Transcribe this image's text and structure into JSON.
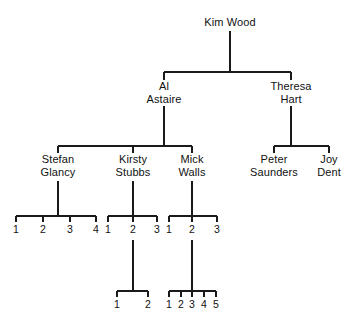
{
  "diagram": {
    "line_color": "#1a1a1a",
    "background": "#ffffff",
    "text_color": "#111111"
  },
  "people": {
    "root": {
      "name": "Kim Wood",
      "line1": "Kim Wood",
      "line2": ""
    },
    "gen2": [
      {
        "name": "Al Astaire",
        "line1": "Al",
        "line2": "Astaire"
      },
      {
        "name": "Theresa Hart",
        "line1": "Theresa",
        "line2": "Hart"
      }
    ],
    "gen3": [
      {
        "name": "Stefan Glancy",
        "line1": "Stefan",
        "line2": "Glancy"
      },
      {
        "name": "Kirsty Stubbs",
        "line1": "Kirsty",
        "line2": "Stubbs"
      },
      {
        "name": "Mick Walls",
        "line1": "Mick",
        "line2": "Walls"
      },
      {
        "name": "Peter Saunders",
        "line1": "Peter",
        "line2": "Saunders"
      },
      {
        "name": "Joy Dent",
        "line1": "Joy",
        "line2": "Dent"
      }
    ]
  },
  "numbered_children": {
    "stefan_glancy_children": [
      "1",
      "2",
      "3",
      "4"
    ],
    "kirsty_stubbs_children": [
      "1",
      "2",
      "3"
    ],
    "mick_walls_children": [
      "1",
      "2",
      "3"
    ],
    "kirsty_grandchildren": [
      "1",
      "2"
    ],
    "mick_grandchildren": [
      "1",
      "2",
      "3",
      "4",
      "5"
    ]
  }
}
